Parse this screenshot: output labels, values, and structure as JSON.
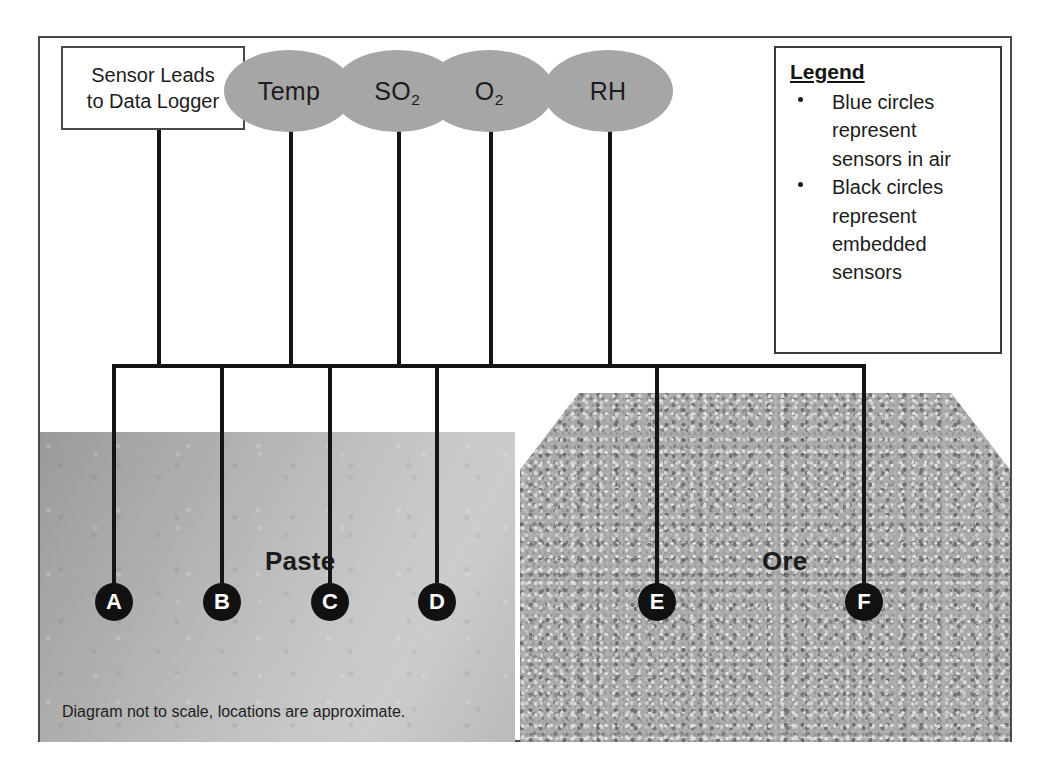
{
  "diagram": {
    "caption": "Diagram not to scale, locations are approximate."
  },
  "lead_box": {
    "label": "Sensor Leads to Data Logger",
    "line1": "Sensor Leads",
    "line2": "to Data Logger"
  },
  "air_sensors": [
    {
      "id": "temp",
      "label": "Temp",
      "base": "Temp",
      "sub": ""
    },
    {
      "id": "so2",
      "label": "SO2",
      "base": "SO",
      "sub": "2"
    },
    {
      "id": "o2",
      "label": "O2",
      "base": "O",
      "sub": "2"
    },
    {
      "id": "rh",
      "label": "RH",
      "base": "RH",
      "sub": ""
    }
  ],
  "embedded_sensors": [
    {
      "id": "a",
      "label": "A",
      "medium": "Paste"
    },
    {
      "id": "b",
      "label": "B",
      "medium": "Paste"
    },
    {
      "id": "c",
      "label": "C",
      "medium": "Paste"
    },
    {
      "id": "d",
      "label": "D",
      "medium": "Paste"
    },
    {
      "id": "e",
      "label": "E",
      "medium": "Ore"
    },
    {
      "id": "f",
      "label": "F",
      "medium": "Ore"
    }
  ],
  "regions": {
    "paste": {
      "label": "Paste",
      "fill": "#bdbdbd"
    },
    "ore": {
      "label": "Ore",
      "fill": "#a9a9a9"
    }
  },
  "legend": {
    "title": "Legend",
    "items": [
      "Blue circles represent sensors in air",
      "Black circles represent embedded sensors"
    ]
  },
  "colors": {
    "air_sensor_fill": "#a6a6a6",
    "embedded_sensor_fill": "#111111",
    "embedded_sensor_text": "#ffffff",
    "wire": "#151515",
    "frame_border": "#4a4a4a"
  }
}
